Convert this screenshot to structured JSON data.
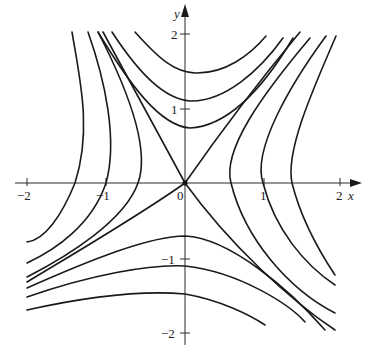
{
  "figure": {
    "origin_px": [
      185,
      183
    ],
    "unit_px": {
      "x": 78,
      "y": 75
    },
    "axes": {
      "x_label": "x",
      "y_label": "y",
      "x_ticks": [
        {
          "value": -2,
          "label": "−2",
          "px": 27
        },
        {
          "value": -1,
          "label": "−1",
          "px": 106
        },
        {
          "value": 1,
          "label": "1",
          "px": 264
        },
        {
          "value": 2,
          "label": "2",
          "px": 340
        }
      ],
      "y_ticks": [
        {
          "value": 2,
          "label": "2",
          "px": 34
        },
        {
          "value": 1,
          "label": "1",
          "px": 109
        },
        {
          "value": -1,
          "label": "−1",
          "px": 259
        },
        {
          "value": -2,
          "label": "−2",
          "px": 333
        }
      ],
      "origin_label": "0"
    },
    "curves": [
      {
        "name": "separatrix-upper-left",
        "d": "M103,32 L185,183"
      },
      {
        "name": "separatrix-upper-right",
        "d": "M300,32 C260,80 215,140 185,183"
      },
      {
        "name": "separatrix-lower-left",
        "d": "M27,282 C80,250 140,215 185,183"
      },
      {
        "name": "separatrix-lower-right",
        "d": "M185,183 C230,245 290,300 335,330"
      },
      {
        "name": "top-curve-1",
        "d": "M135,32 C160,60 175,72 195,73 C225,74 250,55 266,36"
      },
      {
        "name": "top-curve-2",
        "d": "M112,32 C140,75 165,99 190,101 C225,102 260,70 283,38"
      },
      {
        "name": "top-curve-3",
        "d": "M98,32 C130,85 160,126 190,128 C230,126 265,85 293,38"
      },
      {
        "name": "left-curve-1",
        "d": "M72,32 C80,80 92,130 75,183 C62,215 45,240 27,242"
      },
      {
        "name": "left-curve-2",
        "d": "M88,32 C105,80 118,140 106,183 C92,225 55,250 27,263"
      },
      {
        "name": "left-curve-3",
        "d": "M98,32 C128,90 150,150 138,183 C125,220 70,255 27,277"
      },
      {
        "name": "right-curve-1",
        "d": "M310,38 C262,95 222,150 231,183 C245,240 290,290 335,313"
      },
      {
        "name": "right-curve-2",
        "d": "M326,36 C290,85 252,150 263,183 C275,230 305,265 335,285"
      },
      {
        "name": "right-curve-3",
        "d": "M336,36 C315,85 285,150 292,183 C300,215 315,245 335,275"
      },
      {
        "name": "bottom-curve-1",
        "d": "M27,288 C90,260 150,236 185,236 C230,238 290,290 325,330"
      },
      {
        "name": "bottom-curve-2",
        "d": "M27,297 C90,275 150,264 185,266 C240,272 290,305 305,322"
      },
      {
        "name": "bottom-curve-3",
        "d": "M27,310 C90,296 140,290 185,294 C220,300 250,315 265,325"
      }
    ]
  }
}
